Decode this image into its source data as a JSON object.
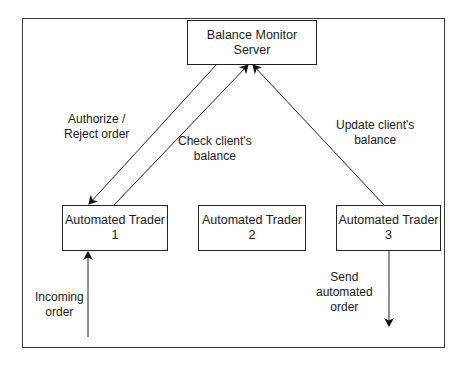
{
  "diagram": {
    "nodes": {
      "server": {
        "line1": "Balance Monitor",
        "line2": "Server"
      },
      "trader1": {
        "line1": "Automated Trader",
        "line2": "1"
      },
      "trader2": {
        "line1": "Automated Trader",
        "line2": "2"
      },
      "trader3": {
        "line1": "Automated Trader",
        "line2": "3"
      }
    },
    "edge_labels": {
      "authorize": {
        "line1": "Authorize /",
        "line2": "Reject order"
      },
      "check": {
        "line1": "Check client's",
        "line2": "balance"
      },
      "update": {
        "line1": "Update client's",
        "line2": "balance"
      },
      "incoming": {
        "line1": "Incoming",
        "line2": "order"
      },
      "send": {
        "line1": "Send",
        "line2": "automated",
        "line3": "order"
      }
    },
    "edges": [
      {
        "from": "server",
        "to": "trader1",
        "label": "authorize"
      },
      {
        "from": "trader1",
        "to": "server",
        "label": "check"
      },
      {
        "from": "trader3",
        "to": "server",
        "label": "update"
      },
      {
        "from": "external",
        "to": "trader1",
        "label": "incoming"
      },
      {
        "from": "trader3",
        "to": "external",
        "label": "send"
      }
    ],
    "colors": {
      "stroke": "#222222",
      "background": "#ffffff"
    }
  }
}
